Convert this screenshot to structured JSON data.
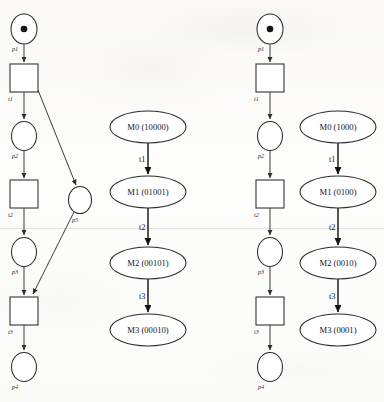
{
  "figure": {
    "background_color": "#fdfdfc",
    "ink_color": "#2b2b2b"
  },
  "panels": [
    {
      "id": "left-petri-net",
      "name": "Petri net with shared place p5",
      "places": [
        {
          "id": "p1",
          "label": "p1",
          "cx": 24,
          "cy": 29,
          "rx": 13,
          "ry": 15,
          "tokens": 1
        },
        {
          "id": "p2",
          "label": "p2",
          "cx": 24,
          "cy": 136,
          "rx": 12.5,
          "ry": 14.5,
          "tokens": 0
        },
        {
          "id": "p3",
          "label": "p3",
          "cx": 24,
          "cy": 252,
          "rx": 12.5,
          "ry": 14.5,
          "tokens": 0
        },
        {
          "id": "p4",
          "label": "p4",
          "cx": 24,
          "cy": 367,
          "rx": 12.5,
          "ry": 14.5,
          "tokens": 0
        },
        {
          "id": "p5",
          "label": "p5",
          "cx": 80,
          "cy": 200,
          "rx": 11.5,
          "ry": 13.5,
          "tokens": 0
        }
      ],
      "transitions": [
        {
          "id": "t1",
          "label": "t1",
          "x": 10,
          "y": 64,
          "w": 28,
          "h": 28
        },
        {
          "id": "t2",
          "label": "t2",
          "x": 10,
          "y": 180,
          "w": 28,
          "h": 28
        },
        {
          "id": "t3",
          "label": "t3",
          "x": 10,
          "y": 297,
          "w": 28,
          "h": 28
        }
      ],
      "arcs": [
        {
          "from": "p1",
          "to": "t1"
        },
        {
          "from": "t1",
          "to": "p2"
        },
        {
          "from": "p2",
          "to": "t2"
        },
        {
          "from": "t2",
          "to": "p3"
        },
        {
          "from": "p3",
          "to": "t3"
        },
        {
          "from": "t3",
          "to": "p4"
        },
        {
          "from": "t1",
          "to": "p5"
        },
        {
          "from": "p5",
          "to": "t3"
        }
      ]
    },
    {
      "id": "left-reachability-graph",
      "name": "Reachability graph for left net",
      "nodes": [
        {
          "id": "M0",
          "label": "M0 (10000)",
          "cx": 148,
          "cy": 127,
          "rx": 38,
          "ry": 16
        },
        {
          "id": "M1",
          "label": "M1 (01001)",
          "cx": 148,
          "cy": 192,
          "rx": 38,
          "ry": 16
        },
        {
          "id": "M2",
          "label": "M2 (00101)",
          "cx": 148,
          "cy": 263,
          "rx": 38,
          "ry": 16
        },
        {
          "id": "M3",
          "label": "M3 (00010)",
          "cx": 148,
          "cy": 330,
          "rx": 38,
          "ry": 16
        }
      ],
      "edges": [
        {
          "from": "M0",
          "to": "M1",
          "label": "t1"
        },
        {
          "from": "M1",
          "to": "M2",
          "label": "t2"
        },
        {
          "from": "M2",
          "to": "M3",
          "label": "t3"
        }
      ]
    },
    {
      "id": "right-petri-net",
      "name": "Simple sequential Petri net",
      "places": [
        {
          "id": "p1",
          "label": "p1",
          "cx": 270,
          "cy": 29,
          "rx": 13,
          "ry": 15,
          "tokens": 1
        },
        {
          "id": "p2",
          "label": "p2",
          "cx": 270,
          "cy": 136,
          "rx": 12.5,
          "ry": 14.5,
          "tokens": 0
        },
        {
          "id": "p3",
          "label": "p3",
          "cx": 270,
          "cy": 252,
          "rx": 12.5,
          "ry": 14.5,
          "tokens": 0
        },
        {
          "id": "p4",
          "label": "p4",
          "cx": 270,
          "cy": 367,
          "rx": 12.5,
          "ry": 14.5,
          "tokens": 0
        }
      ],
      "transitions": [
        {
          "id": "t1",
          "label": "t1",
          "x": 256,
          "y": 64,
          "w": 28,
          "h": 28
        },
        {
          "id": "t2",
          "label": "t2",
          "x": 256,
          "y": 180,
          "w": 28,
          "h": 28
        },
        {
          "id": "t3",
          "label": "t3",
          "x": 256,
          "y": 297,
          "w": 28,
          "h": 28
        }
      ],
      "arcs": [
        {
          "from": "p1",
          "to": "t1"
        },
        {
          "from": "t1",
          "to": "p2"
        },
        {
          "from": "p2",
          "to": "t2"
        },
        {
          "from": "t2",
          "to": "p3"
        },
        {
          "from": "p3",
          "to": "t3"
        },
        {
          "from": "t3",
          "to": "p4"
        }
      ]
    },
    {
      "id": "right-reachability-graph",
      "name": "Reachability graph for right net",
      "nodes": [
        {
          "id": "M0",
          "label": "M0 (1000)",
          "cx": 338,
          "cy": 127,
          "rx": 38,
          "ry": 16
        },
        {
          "id": "M1",
          "label": "M1 (0100)",
          "cx": 338,
          "cy": 192,
          "rx": 38,
          "ry": 16
        },
        {
          "id": "M2",
          "label": "M2 (0010)",
          "cx": 338,
          "cy": 263,
          "rx": 38,
          "ry": 16
        },
        {
          "id": "M3",
          "label": "M3 (0001)",
          "cx": 338,
          "cy": 330,
          "rx": 38,
          "ry": 16
        }
      ],
      "edges": [
        {
          "from": "M0",
          "to": "M1",
          "label": "t1"
        },
        {
          "from": "M1",
          "to": "M2",
          "label": "t2"
        },
        {
          "from": "M2",
          "to": "M3",
          "label": "t3"
        }
      ]
    }
  ],
  "labels": {
    "left_net": {
      "p1": "p1",
      "p2": "p2",
      "p3": "p3",
      "p4": "p4",
      "p5": "p5",
      "t1": "t1",
      "t2": "t2",
      "t3": "t3"
    },
    "right_net": {
      "p1": "p1",
      "p2": "p2",
      "p3": "p3",
      "p4": "p4",
      "t1": "t1",
      "t2": "t2",
      "t3": "t3"
    },
    "left_graph": {
      "m0": "M0 (10000)",
      "m1": "M1 (01001)",
      "m2": "M2 (00101)",
      "m3": "M3 (00010)",
      "e1": "t1",
      "e2": "t2",
      "e3": "t3"
    },
    "right_graph": {
      "m0": "M0 (1000)",
      "m1": "M1 (0100)",
      "m2": "M2 (0010)",
      "m3": "M3 (0001)",
      "e1": "t1",
      "e2": "t2",
      "e3": "t3"
    }
  }
}
